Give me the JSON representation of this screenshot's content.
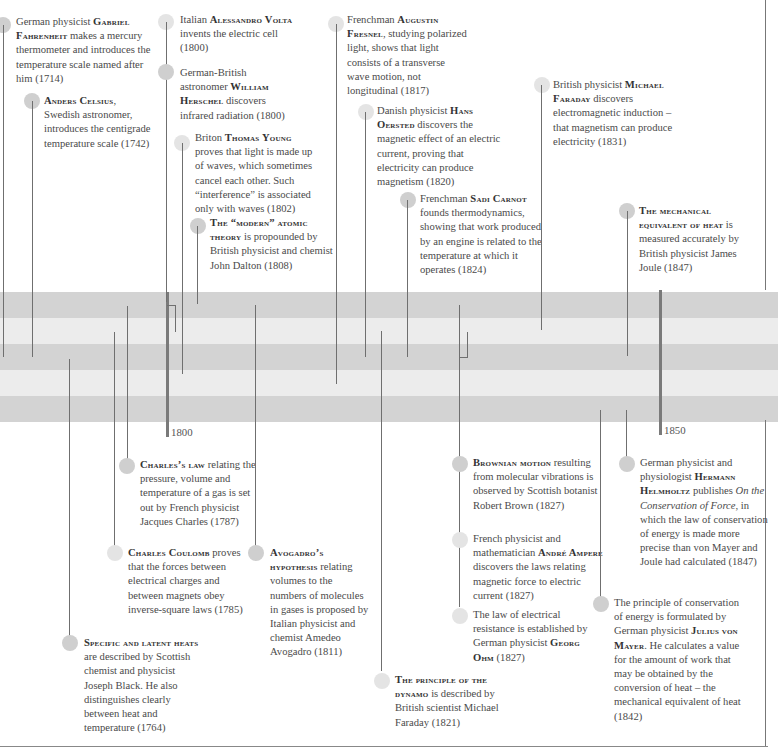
{
  "timeline": {
    "axis_labels": {
      "y1800": "1800",
      "y1850": "1850"
    },
    "band_colors": {
      "dark": "#d3d3d3",
      "light": "#ececec"
    },
    "events": {
      "fahrenheit": {
        "pre": "German physicist ",
        "name": "Gabriel Fahrenheit",
        "post": " makes a mercury thermometer and introduces the temperature scale named after him (1714)",
        "year": "1714"
      },
      "celsius": {
        "pre": "",
        "name": "Anders Celsius",
        "post": ", Swedish astronomer, introduces the centigrade temperature scale (1742)",
        "year": "1742"
      },
      "volta": {
        "pre": "Italian ",
        "name": "Alessandro Volta",
        "post": " invents the electric cell (1800)",
        "year": "1800"
      },
      "herschel": {
        "pre": "German-British astronomer ",
        "name": "William Herschel",
        "post": " discovers infrared radiation (1800)",
        "year": "1800"
      },
      "young": {
        "pre": "Briton ",
        "name": "Thomas Young",
        "post": " proves that light is made up of waves, which sometimes cancel each other. Such “interference” is associated only with waves (1802)",
        "year": "1802"
      },
      "dalton": {
        "pre": "",
        "name": "The “modern” atomic theory",
        "post": " is propounded by British physicist and chemist John Dalton (1808)",
        "year": "1808"
      },
      "fresnel": {
        "pre": "Frenchman ",
        "name": "Augustin Fresnel",
        "post": ", studying polarized light, shows that light consists of a transverse wave motion, not longitudinal (1817)",
        "year": "1817"
      },
      "oersted": {
        "pre": "Danish physicist ",
        "name": "Hans Oersted",
        "post": " discovers the magnetic effect of an electric current, proving that electricity can produce magnetism (1820)",
        "year": "1820"
      },
      "carnot": {
        "pre": "Frenchman ",
        "name": "Sadi Carnot",
        "post": " founds thermodynamics, showing that  work produced by an engine is related to the temperature at which it operates (1824)",
        "year": "1824"
      },
      "faraday_induction": {
        "pre": "British physicist ",
        "name": "Michael Faraday",
        "post": " discovers electromagnetic induction – that magnetism can produce electricity (1831)",
        "year": "1831"
      },
      "joule": {
        "pre": "",
        "name": "The mechanical equivalent of heat",
        "post": " is measured accurately by British physicist James Joule (1847)",
        "year": "1847"
      },
      "charles": {
        "pre": "",
        "name": "Charles’s law",
        "post": " relating the pressure, volume and temperature of a gas is set out by French physicist Jacques Charles (1787)",
        "year": "1787"
      },
      "coulomb": {
        "pre": "",
        "name": "Charles Coulomb",
        "post": " proves that the forces between electrical charges and between magnets obey inverse-square laws (1785)",
        "year": "1785"
      },
      "avogadro": {
        "pre": "",
        "name": "Avogadro’s hypothesis",
        "post": " relating volumes to the numbers of molecules in gases is proposed by Italian physicist and chemist Amedeo Avogadro (1811)",
        "year": "1811"
      },
      "black": {
        "pre": "",
        "name": "Specific and latent heats",
        "post": " are described by Scottish chemist and physicist Joseph Black. He also distinguishes clearly between heat and temperature (1764)",
        "year": "1764"
      },
      "dynamo": {
        "pre": "",
        "name": "The principle of the dynamo",
        "post": " is described by British scientist Michael Faraday (1821)",
        "year": "1821"
      },
      "brown": {
        "pre": "",
        "name": "Brownian motion",
        "post": " resulting from molecular vibrations is observed by Scottish botanist Robert Brown (1827)",
        "year": "1827"
      },
      "ampere": {
        "pre": "French physicist and mathematician ",
        "name": "André Ampere",
        "post": " discovers the laws relating magnetic force to electric current (1827)",
        "year": "1827"
      },
      "ohm": {
        "pre": "The law of electrical resistance is established by German physicist ",
        "name": "Georg Ohm",
        "post": " (1827)",
        "year": "1827"
      },
      "helmholtz": {
        "pre": "German physicist and physiologist ",
        "name": "Hermann Helmholtz",
        "mid": " publishes ",
        "title": "On the Conservation of Force",
        "post": ", in which the law of conservation of energy is made more precise than von Mayer and Joule had calculated (1847)",
        "year": "1847"
      },
      "mayer": {
        "pre": "The principle of conservation of energy is formulated by German physicist ",
        "name": "Julius von Mayer",
        "post": ". He calculates a value for the amount of work that may be obtained by the conversion of heat – the mechanical equivalent of heat (1842)",
        "year": "1842"
      }
    }
  }
}
